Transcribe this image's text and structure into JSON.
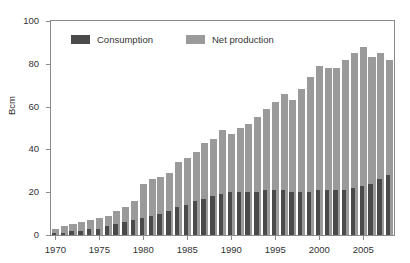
{
  "chart_data": {
    "type": "bar",
    "title": "",
    "subtitle": "",
    "xlabel": "",
    "ylabel": "Bcm",
    "ylim": [
      0,
      100
    ],
    "xlim": [
      1969.5,
      2008.5
    ],
    "grid": false,
    "legend_position": "top-inside",
    "y_ticks": [
      0,
      20,
      40,
      60,
      80,
      100
    ],
    "x_ticks": [
      1970,
      1975,
      1980,
      1985,
      1990,
      1995,
      2000,
      2005
    ],
    "categories": [
      1970,
      1971,
      1972,
      1973,
      1974,
      1975,
      1976,
      1977,
      1978,
      1979,
      1980,
      1981,
      1982,
      1983,
      1984,
      1985,
      1986,
      1987,
      1988,
      1989,
      1990,
      1991,
      1992,
      1993,
      1994,
      1995,
      1996,
      1997,
      1998,
      1999,
      2000,
      2001,
      2002,
      2003,
      2004,
      2005,
      2006,
      2007,
      2008
    ],
    "series": [
      {
        "name": "Net production",
        "color": "#9a9a9a",
        "values": [
          3,
          4,
          5,
          6,
          7,
          8,
          9,
          11,
          13,
          16,
          24,
          26,
          27,
          29,
          34,
          36,
          39,
          43,
          45,
          49,
          47,
          50,
          52,
          55,
          59,
          62,
          66,
          63,
          68,
          74,
          79,
          78,
          78,
          82,
          85,
          88,
          83,
          85,
          82
        ]
      },
      {
        "name": "Consumption",
        "color": "#4a4a4a",
        "values": [
          1,
          1,
          2,
          2,
          3,
          3,
          4,
          5,
          6,
          7,
          8,
          9,
          10,
          11,
          13,
          14,
          16,
          17,
          18,
          19,
          20,
          20,
          20,
          20,
          21,
          21,
          21,
          20,
          20,
          20,
          21,
          21,
          21,
          21,
          22,
          23,
          24,
          26,
          28
        ]
      }
    ]
  },
  "legend": {
    "items": [
      {
        "label": "Consumption",
        "color": "#4a4a4a"
      },
      {
        "label": "Net production",
        "color": "#9a9a9a"
      }
    ]
  },
  "axes": {
    "y_title": "Bcm",
    "y_tick_labels": [
      "0",
      "20",
      "40",
      "60",
      "80",
      "100"
    ],
    "x_tick_labels": [
      "1970",
      "1975",
      "1980",
      "1985",
      "1990",
      "1995",
      "2000",
      "2005"
    ]
  }
}
